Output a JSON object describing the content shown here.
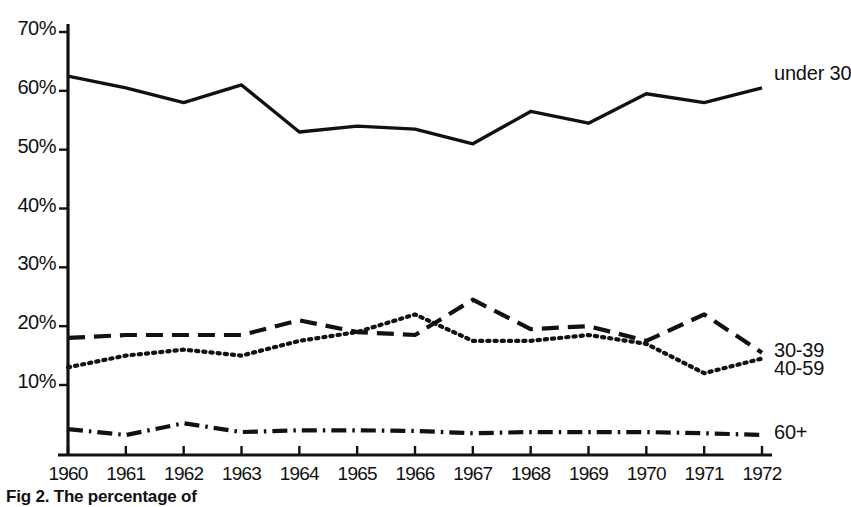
{
  "figure": {
    "caption": "Fig 2. The percentage of",
    "ylabel": "",
    "xlabel": ""
  },
  "axes": {
    "y_ticks": [
      "10%",
      "20%",
      "30%",
      "40%",
      "50%",
      "60%",
      "70%"
    ],
    "x_ticks": [
      "1960",
      "1961",
      "1962",
      "1963",
      "1964",
      "1965",
      "1966",
      "1967",
      "1968",
      "1969",
      "1970",
      "1971",
      "1972"
    ]
  },
  "series_labels": {
    "under30": "under 30",
    "age30_39": "30-39",
    "age40_59": "40-59",
    "age60plus": "60+"
  },
  "colors": {
    "ink": "#111111",
    "paper": "#ffffff"
  },
  "chart_data": {
    "type": "line",
    "title": "",
    "xlabel": "",
    "ylabel": "",
    "x": [
      1960,
      1961,
      1962,
      1963,
      1964,
      1965,
      1966,
      1967,
      1968,
      1969,
      1970,
      1971,
      1972
    ],
    "xlim": [
      1960,
      1972
    ],
    "ylim": [
      0,
      70
    ],
    "yticks": [
      10,
      20,
      30,
      40,
      50,
      60,
      70
    ],
    "ytick_labels": [
      "10%",
      "20%",
      "30%",
      "40%",
      "50%",
      "60%",
      "70%"
    ],
    "grid": false,
    "legend_position": "right-of-line-ends",
    "series": [
      {
        "name": "under 30",
        "style": "solid",
        "values": [
          62.5,
          60.5,
          58.0,
          61.0,
          53.0,
          54.0,
          53.5,
          51.0,
          56.5,
          54.5,
          59.5,
          58.0,
          60.5
        ]
      },
      {
        "name": "30-39",
        "style": "dashed",
        "values": [
          18.0,
          18.5,
          18.5,
          18.5,
          21.0,
          19.0,
          18.5,
          24.5,
          19.5,
          20.0,
          17.5,
          22.0,
          15.5
        ]
      },
      {
        "name": "40-59",
        "style": "dotted",
        "values": [
          13.0,
          15.0,
          16.0,
          15.0,
          17.5,
          19.0,
          22.0,
          17.5,
          17.5,
          18.5,
          17.0,
          12.0,
          14.5
        ]
      },
      {
        "name": "60+",
        "style": "dash-dot",
        "values": [
          2.5,
          1.5,
          3.5,
          2.0,
          2.3,
          2.3,
          2.2,
          1.8,
          2.0,
          2.0,
          2.0,
          1.8,
          1.5
        ]
      }
    ]
  }
}
